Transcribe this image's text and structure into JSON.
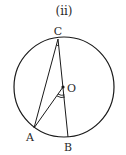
{
  "figure": {
    "title": "(ii)",
    "circle": {
      "cx": 64,
      "cy": 87,
      "r": 50
    },
    "points": {
      "C": {
        "label": "C",
        "x": 58,
        "y": 39
      },
      "O": {
        "label": "O",
        "x": 63,
        "y": 87
      },
      "A": {
        "label": "A",
        "x": 34,
        "y": 128
      },
      "B": {
        "label": "B",
        "x": 68,
        "y": 137
      }
    },
    "segments": [
      "CA",
      "CB",
      "OA"
    ],
    "angle_marks": [
      "angle ACB (single arc at C)",
      "angle AOB (double arc at O)"
    ],
    "stroke_color": "#1a1a1a"
  }
}
